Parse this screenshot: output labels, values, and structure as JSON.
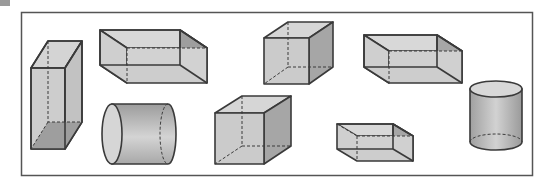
{
  "figure": {
    "title": "",
    "colors": {
      "frame": "#555555",
      "edge": "#3a3a3a",
      "face_light": "#d6d6d6",
      "face_mid": "#c4c4c4",
      "face_dark": "#9e9e9e"
    },
    "shapes": [
      {
        "id": "tall-rectangular-prism",
        "kind": "rectangular prism",
        "orientation": "vertical"
      },
      {
        "id": "flat-rectangular-prism-1",
        "kind": "rectangular prism",
        "orientation": "horizontal"
      },
      {
        "id": "horizontal-cylinder",
        "kind": "cylinder",
        "orientation": "horizontal"
      },
      {
        "id": "cube-1",
        "kind": "cube"
      },
      {
        "id": "cube-2",
        "kind": "cube"
      },
      {
        "id": "flat-rectangular-prism-2",
        "kind": "rectangular prism",
        "orientation": "horizontal"
      },
      {
        "id": "small-rectangular-prism",
        "kind": "rectangular prism",
        "orientation": "horizontal"
      },
      {
        "id": "vertical-cylinder",
        "kind": "cylinder",
        "orientation": "vertical"
      }
    ]
  }
}
